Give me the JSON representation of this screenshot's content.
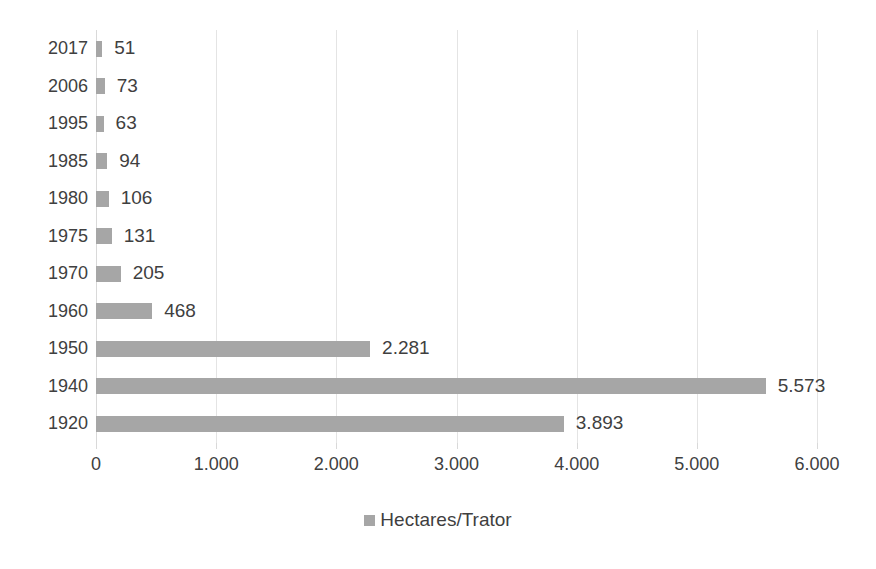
{
  "chart_data": {
    "type": "bar",
    "orientation": "horizontal",
    "title": "",
    "subtitle": "",
    "xlabel": "",
    "ylabel": "",
    "categories": [
      "2017",
      "2006",
      "1995",
      "1985",
      "1980",
      "1975",
      "1970",
      "1960",
      "1950",
      "1940",
      "1920"
    ],
    "values": [
      51,
      73,
      63,
      94,
      106,
      131,
      205,
      468,
      2281,
      5573,
      3893
    ],
    "data_labels": [
      "51",
      "73",
      "63",
      "94",
      "106",
      "131",
      "205",
      "468",
      "2.281",
      "5.573",
      "3.893"
    ],
    "series": [
      {
        "name": "Hectares/Trator",
        "color": "#a6a6a6",
        "values": [
          51,
          73,
          63,
          94,
          106,
          131,
          205,
          468,
          2281,
          5573,
          3893
        ]
      }
    ],
    "xlim": [
      0,
      6000
    ],
    "xticks": [
      0,
      1000,
      2000,
      3000,
      4000,
      5000,
      6000
    ],
    "xtick_labels": [
      "0",
      "1.000",
      "2.000",
      "3.000",
      "4.000",
      "5.000",
      "6.000"
    ],
    "grid": "vertical",
    "legend": {
      "position": "bottom",
      "entries": [
        {
          "label": "Hectares/Trator",
          "marker": "square-marker",
          "color": "#a6a6a6"
        }
      ]
    },
    "colors": {
      "bar": "#a6a6a6",
      "gridline": "#e4e4e4",
      "axis": "#d9d9d9",
      "text": "#404040",
      "background": "#ffffff"
    }
  }
}
